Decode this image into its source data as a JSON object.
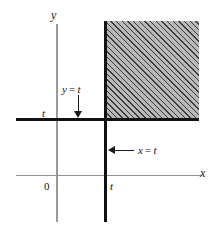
{
  "figure": {
    "background_color": "#ffffff",
    "axes": {
      "y_axis_name": "y",
      "x_axis_name": "x",
      "origin_label": "0",
      "axis_color": "#9a9a9a"
    },
    "ticks": {
      "x_tick_label": "t",
      "y_tick_label": "t"
    },
    "callouts": [
      {
        "id": "y-equals-t",
        "text": "y = t",
        "lhs": "y",
        "operator": "=",
        "rhs": "t",
        "arrow_direction": "down",
        "points_at": "horizontal-boundary-line"
      },
      {
        "id": "x-equals-t",
        "text": "x = t",
        "lhs": "x",
        "operator": "=",
        "rhs": "t",
        "arrow_direction": "left",
        "points_at": "vertical-boundary-line"
      }
    ],
    "region": {
      "name": "shaded-quadrant",
      "fill_color": "#b9b9b9",
      "hatch_color": "#3a3a3a",
      "hatch_angle_deg": 45,
      "description": "x > t and y > t"
    },
    "boundary_lines": {
      "color": "#111111",
      "horizontal_label": "y = t",
      "vertical_label": "x = t"
    }
  },
  "chart_data": {
    "type": "line",
    "title": "",
    "xlabel": "x",
    "ylabel": "y",
    "xlim": [
      -1.1,
      3.4
    ],
    "ylim": [
      -1.3,
      3.6
    ],
    "grid": false,
    "legend": null,
    "tick_labels": {
      "x": [
        "0",
        "t"
      ],
      "y": [
        "t"
      ]
    },
    "series": [
      {
        "name": "y = t",
        "type": "horizontal-line",
        "value": 1,
        "x_range": [
          -1.05,
          2.95
        ],
        "style": "thick-solid",
        "color": "#111111"
      },
      {
        "name": "x = t",
        "type": "vertical-line",
        "value": 1,
        "y_range": [
          -1.25,
          3.5
        ],
        "style": "thick-solid",
        "color": "#111111"
      }
    ],
    "shaded_regions": [
      {
        "name": "x > t and y > t",
        "x_from": 1,
        "x_to": 3.0,
        "y_from": 1,
        "y_to": 3.5,
        "fill": "#b9b9b9",
        "hatch": "///"
      }
    ],
    "annotations": [
      {
        "text": "y = t",
        "x": 0.32,
        "y": 1.9,
        "arrow_to": [
          0.32,
          1.02
        ]
      },
      {
        "text": "x = t",
        "x": 1.75,
        "y": 0.38,
        "arrow_to": [
          1.02,
          0.38
        ]
      },
      {
        "text": "0",
        "x": -0.18,
        "y": -0.17
      },
      {
        "text": "t",
        "x": 1.06,
        "y": -0.17
      },
      {
        "text": "t",
        "x": -0.25,
        "y": 1.08
      },
      {
        "text": "y",
        "x": -0.05,
        "y": 3.45
      },
      {
        "text": "x",
        "x": 3.3,
        "y": 0.1
      }
    ]
  }
}
